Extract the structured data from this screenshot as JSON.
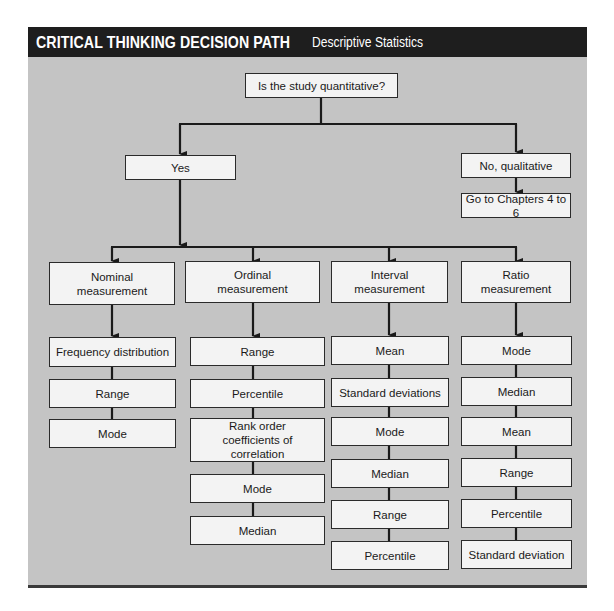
{
  "header": {
    "title": "CRITICAL THINKING DECISION PATH",
    "subtitle": "Descriptive Statistics"
  },
  "colors": {
    "header_bg": "#1e1e1e",
    "panel_bg": "#c4c4c4",
    "box_bg": "#f3f3f3",
    "line": "#1a1a1a"
  },
  "root": {
    "label": "Is the study quantitative?"
  },
  "branches": {
    "yes": {
      "label": "Yes"
    },
    "no": {
      "label": "No, qualitative",
      "next": "Go to Chapters 4 to 6"
    }
  },
  "columns": [
    {
      "level": "Nominal measurement",
      "stats": [
        "Frequency distribution",
        "Range",
        "Mode"
      ]
    },
    {
      "level": "Ordinal measurement",
      "stats": [
        "Range",
        "Percentile",
        "Rank order coefficients of correlation",
        "Mode",
        "Median"
      ]
    },
    {
      "level": "Interval measurement",
      "stats": [
        "Mean",
        "Standard deviations",
        "Mode",
        "Median",
        "Range",
        "Percentile"
      ]
    },
    {
      "level": "Ratio measurement",
      "stats": [
        "Mode",
        "Median",
        "Mean",
        "Range",
        "Percentile",
        "Standard deviation"
      ]
    }
  ]
}
